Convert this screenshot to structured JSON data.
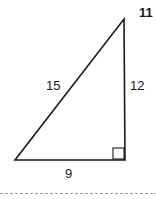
{
  "diagram": {
    "type": "right-triangle",
    "problem_number": "11",
    "sides": {
      "hypotenuse": "15",
      "vertical_leg": "12",
      "horizontal_leg": "9"
    },
    "right_angle_marker": true
  }
}
